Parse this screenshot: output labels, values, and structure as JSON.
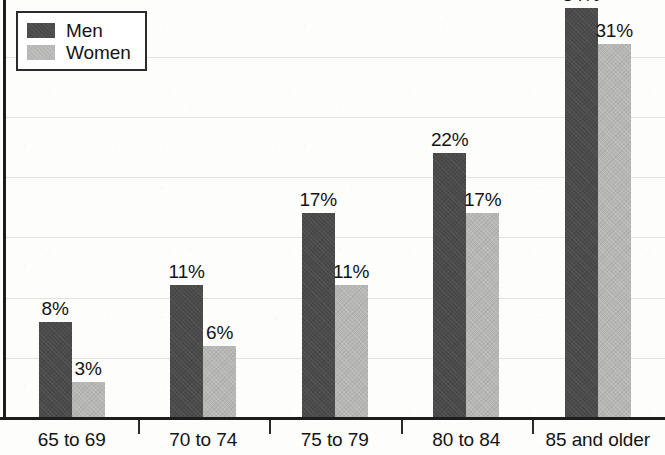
{
  "chart_data": {
    "type": "bar",
    "title": "",
    "subtitle": "",
    "xlabel": "",
    "ylabel": "",
    "grid": true,
    "legend_position": "top-left",
    "ylim": [
      0,
      35
    ],
    "y_gridline_values": [
      0,
      5,
      10,
      15,
      20,
      25,
      30,
      35
    ],
    "categories": [
      "65 to 69",
      "70 to 74",
      "75 to 79",
      "80 to 84",
      "85 and older"
    ],
    "series": [
      {
        "name": "Men",
        "color": "#4a4a4a",
        "values": [
          8,
          11,
          17,
          22,
          34
        ],
        "labels": [
          "8%",
          "11%",
          "17%",
          "22%",
          "34%"
        ]
      },
      {
        "name": "Women",
        "color": "#b6b6b4",
        "values": [
          3,
          6,
          11,
          17,
          31
        ],
        "labels": [
          "3%",
          "6%",
          "11%",
          "17%",
          "31%"
        ]
      }
    ]
  },
  "legend": {
    "items": [
      {
        "label": "Men",
        "swatch": "men-swatch"
      },
      {
        "label": "Women",
        "swatch": "women-swatch"
      }
    ]
  },
  "axis": {
    "baseline_color": "#1d1d1d",
    "gridline_color": "#e3e3e1"
  }
}
